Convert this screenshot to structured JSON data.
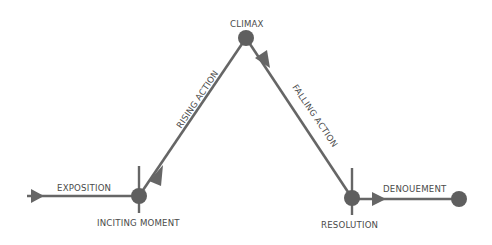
{
  "diagram": {
    "colors": {
      "line": "#666666",
      "node": "#5f5f5f",
      "text": "#4a4a4a",
      "background": "#ffffff"
    },
    "labels": {
      "exposition": "EXPOSITION",
      "inciting_moment": "INCITING MOMENT",
      "rising_action": "RISING ACTION",
      "climax": "CLIMAX",
      "falling_action": "FALLING ACTION",
      "resolution": "RESOLUTION",
      "denouement": "DENOUEMENT"
    },
    "nodes": [
      {
        "id": "inciting-moment",
        "x": 139,
        "y": 196
      },
      {
        "id": "climax",
        "x": 246,
        "y": 38
      },
      {
        "id": "resolution",
        "x": 352,
        "y": 198
      },
      {
        "id": "end",
        "x": 459,
        "y": 199
      }
    ]
  }
}
